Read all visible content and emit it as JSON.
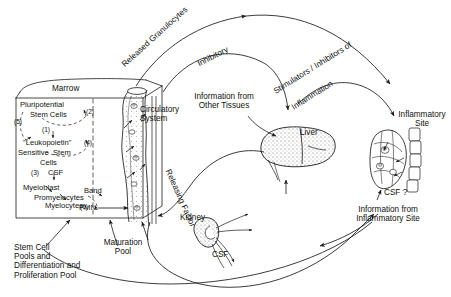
{
  "diagram": {
    "ink_color": "#1a1a1a",
    "background": "#ffffff"
  },
  "marrow": {
    "box_label": "Marrow",
    "stem_cell_lines": {
      "pluripotential": "Pluripotential",
      "stem_cells": "Stem Cells",
      "leukopoietin": "\"Leukopoietin\"",
      "sensitive_stem": "Sensitive  Stem",
      "cells": "Cells",
      "csf": "CSF",
      "myeloblast": "Myeloblast",
      "promyelocytes": "Promyelocytes",
      "myelocytes": "Myelocytes",
      "band": "Band",
      "pmn": "PMN"
    },
    "markers": {
      "m1": "(1)",
      "m2": "(2)",
      "m3": "(3)",
      "m4": "(4)",
      "m5": "(5)",
      "m6": "(6)"
    }
  },
  "labels": {
    "circulatory_system": "Circulatory\nSystem",
    "released_granulocytes": "Released Granulocytes",
    "inhibitory": "Inhibitory",
    "information_other_tissues": "Information from\nOther Tissues",
    "stimulators_inhibitors": "Stimulators / Inhibitors of",
    "inflammation": "Inflammation",
    "liver": "Liver",
    "releasing_factor": "Releasing Factor",
    "kidney": "Kidney",
    "csf_kidney": "CSF",
    "inflammatory_site": "Inflammatory\nSite",
    "csf_question": "CSF ?",
    "information_inflammatory_site": "Information from\nInflammatory Site",
    "stem_cell_pools": "Stem Cell\nPools and\nDifferentiation and\nProliferation Pool",
    "maturation_pool": "Maturation\nPool"
  }
}
